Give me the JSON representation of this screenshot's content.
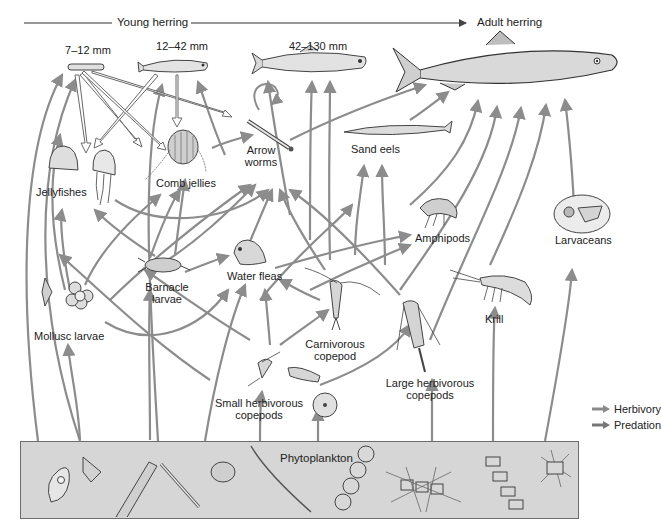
{
  "header": {
    "young_herring": "Young herring",
    "adult_herring": "Adult herring"
  },
  "herring_stages": [
    {
      "size": "7–12 mm"
    },
    {
      "size": "12–42 mm"
    },
    {
      "size": "42–130 mm"
    }
  ],
  "organisms": {
    "jellyfishes": "Jellyfishes",
    "comb_jellies": "Comb jellies",
    "arrow_worms_1": "Arrow",
    "arrow_worms_2": "worms",
    "sand_eels": "Sand eels",
    "amphipods": "Amphipods",
    "larvaceans": "Larvaceans",
    "barnacle_1": "Barnacle",
    "barnacle_2": "larvae",
    "water_fleas": "Water fleas",
    "mollusc_larvae": "Mollusc larvae",
    "carnivorous_1": "Carnivorous",
    "carnivorous_2": "copepod",
    "krill": "Krill",
    "large_herb_1": "Large herbivorous",
    "large_herb_2": "copepods",
    "small_herb_1": "Small herbivorous",
    "small_herb_2": "copepods",
    "phytoplankton": "Phytoplankton"
  },
  "legend": {
    "herbivory": "Herbivory",
    "predation": "Predation",
    "herbivory_color": "#8a8a8a",
    "predation_color": "#777777"
  },
  "colors": {
    "arrow": "#8c8c8c",
    "hollow_arrow_stroke": "#6a6a6a",
    "phyto_fill": "#d6d6d6",
    "organism_fill": "#e8e8e8",
    "organism_stroke": "#444444"
  }
}
